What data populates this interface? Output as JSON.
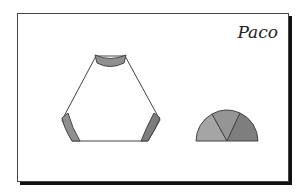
{
  "card": {
    "name": "Paco"
  },
  "figure": {
    "shapes": [
      {
        "type": "truncated-hexagon-outline",
        "shaded_parts": [
          "top-arc",
          "bottom-left-arc",
          "bottom-right-arc"
        ]
      },
      {
        "type": "semicircle",
        "segments": 3
      }
    ],
    "colors": {
      "light": "#a8a8a8",
      "mid": "#939393",
      "dark": "#7a7a7a",
      "outline": "#444444"
    }
  }
}
